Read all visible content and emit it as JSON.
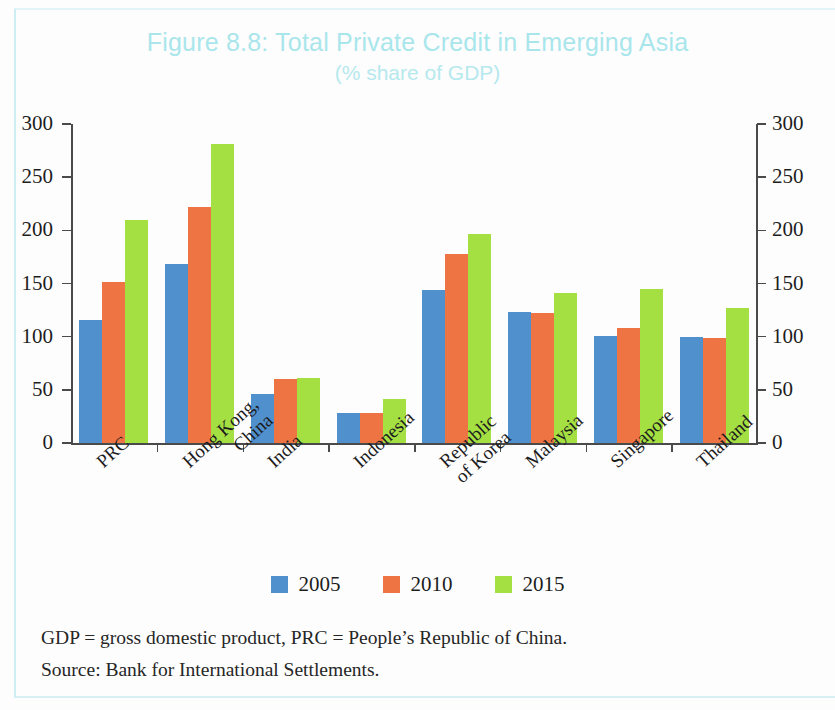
{
  "figure": {
    "title": "Figure 8.8: Total Private Credit in Emerging Asia",
    "subtitle": "(% share of GDP)",
    "title_color": "#a9e6ec"
  },
  "notes": {
    "abbreviations": "GDP = gross domestic product, PRC = People’s Republic of China.",
    "source": "Source: Bank for International Settlements."
  },
  "legend": {
    "position": "bottom-center",
    "items": [
      {
        "label": "2005",
        "color": "#4f90cd"
      },
      {
        "label": "2010",
        "color": "#ee7444"
      },
      {
        "label": "2015",
        "color": "#a5e043"
      }
    ]
  },
  "axes": {
    "left_ticks": [
      "300",
      "250",
      "200",
      "150",
      "100",
      "50",
      "0"
    ],
    "right_ticks": [
      "300",
      "250",
      "200",
      "150",
      "100",
      "50",
      "0"
    ],
    "ylim": [
      0,
      300
    ],
    "ystep": 50,
    "grid": false
  },
  "chart_data": {
    "type": "bar",
    "title": "Figure 8.8: Total Private Credit in Emerging Asia",
    "subtitle": "(% share of GDP)",
    "xlabel": "",
    "ylabel": "",
    "ylim": [
      0,
      300
    ],
    "ytick_step": 50,
    "grid": false,
    "legend_position": "bottom-center",
    "categories": [
      "PRC",
      "Hong Kong, China",
      "India",
      "Indonesia",
      "Republic of Korea",
      "Malaysia",
      "Singapore",
      "Thailand"
    ],
    "category_lines": [
      [
        "PRC"
      ],
      [
        "Hong Kong,",
        "China"
      ],
      [
        "India"
      ],
      [
        "Indonesia"
      ],
      [
        "Republic",
        "of Korea"
      ],
      [
        "Malaysia"
      ],
      [
        "Singapore"
      ],
      [
        "Thailand"
      ]
    ],
    "series": [
      {
        "name": "2005",
        "color": "#4f90cd",
        "values": [
          116,
          168,
          46,
          28,
          144,
          123,
          101,
          100
        ]
      },
      {
        "name": "2010",
        "color": "#ee7444",
        "values": [
          151,
          222,
          60,
          28,
          178,
          122,
          108,
          99
        ]
      },
      {
        "name": "2015",
        "color": "#a5e043",
        "values": [
          210,
          281,
          61,
          41,
          197,
          141,
          145,
          127
        ]
      }
    ],
    "notes": [
      "GDP = gross domestic product, PRC = People’s Republic of China.",
      "Source: Bank for International Settlements."
    ]
  }
}
